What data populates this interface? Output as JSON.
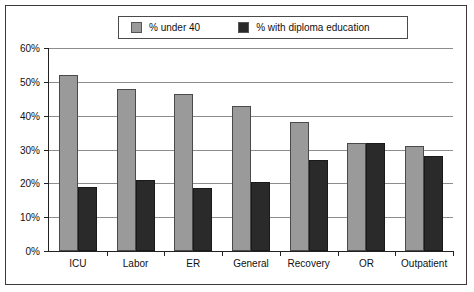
{
  "chart_data": {
    "type": "bar",
    "title": "",
    "xlabel": "",
    "ylabel": "",
    "categories": [
      "ICU",
      "Labor",
      "ER",
      "General",
      "Recovery",
      "OR",
      "Outpatient"
    ],
    "series": [
      {
        "name": "% under 40",
        "color": "#9a9a9a",
        "values": [
          52,
          48,
          46.5,
          43,
          38,
          32,
          31
        ]
      },
      {
        "name": "% with diploma education",
        "color": "#2a2a2a",
        "values": [
          19,
          21,
          18.5,
          20.5,
          27,
          32,
          28
        ]
      }
    ],
    "ylim": [
      0,
      60
    ],
    "ytick_values": [
      0,
      10,
      20,
      30,
      40,
      50,
      60
    ],
    "ytick_labels": [
      "0%",
      "10%",
      "20%",
      "30%",
      "40%",
      "50%",
      "60%"
    ],
    "grid": true,
    "legend_position": "top"
  },
  "legend": {
    "entries": [
      {
        "label": "% under 40",
        "swatch": "grey"
      },
      {
        "label": "% with diploma education",
        "swatch": "dark"
      }
    ]
  },
  "colors": {
    "series_a": "#9a9a9a",
    "series_b": "#2a2a2a",
    "grid": "#8d8d8d",
    "axis": "#222222",
    "frame": "#3a3a3a",
    "background": "#ffffff"
  }
}
